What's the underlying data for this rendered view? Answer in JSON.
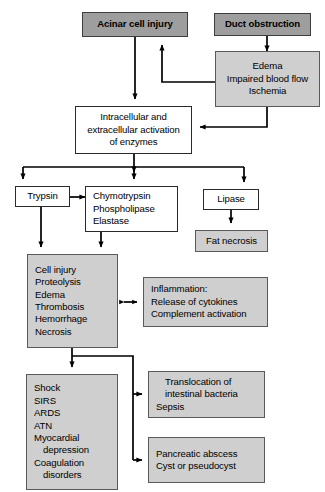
{
  "diagram": {
    "colors": {
      "node_dark_fill": "#9e9e9e",
      "node_gray_fill": "#cfcfcf",
      "node_white_fill": "#ffffff",
      "edge_stroke": "#000000",
      "text": "#000000"
    },
    "nodes": {
      "acinar_cell_injury": {
        "label": "Acinar cell injury"
      },
      "duct_obstruction": {
        "label": "Duct obstruction"
      },
      "edema_block": {
        "lines": [
          "Edema",
          "Impaired blood flow",
          "Ischemia"
        ]
      },
      "enzyme_activation": {
        "lines": [
          "Intracellular and",
          "extracellular activation",
          "of enzymes"
        ]
      },
      "trypsin": {
        "label": "Trypsin"
      },
      "chymotrypsin_group": {
        "lines": [
          "Chymotrypsin",
          "Phospholipase",
          "Elastase"
        ]
      },
      "lipase": {
        "label": "Lipase"
      },
      "fat_necrosis": {
        "label": "Fat necrosis"
      },
      "cell_injury_block": {
        "lines": [
          "Cell injury",
          "Proteolysis",
          "Edema",
          "Thrombosis",
          "Hemorrhage",
          "Necrosis"
        ]
      },
      "inflammation_block": {
        "lines": [
          "Inflammation:",
          "Release of cytokines",
          "Complement activation"
        ]
      },
      "systemic_block": {
        "lines": [
          "Shock",
          "SIRS",
          "ARDS",
          "ATN",
          "Myocardial",
          "depression",
          "Coagulation",
          "disorders"
        ],
        "indented_lines": [
          5,
          7
        ]
      },
      "translocation_block": {
        "lines": [
          "Translocation of",
          "intestinal bacteria",
          "Sepsis"
        ],
        "indented_lines": [
          1
        ]
      },
      "abscess_block": {
        "lines": [
          "Pancreatic abscess",
          "Cyst or pseudocyst"
        ]
      }
    },
    "edges": [
      {
        "from": "acinar_cell_injury",
        "to": "enzyme_activation",
        "style": "arrow-down"
      },
      {
        "from": "duct_obstruction",
        "to": "edema_block",
        "style": "arrow-down"
      },
      {
        "from": "edema_block",
        "to": "acinar_cell_injury",
        "style": "feedback-arrow-up"
      },
      {
        "from": "edema_block",
        "to": "enzyme_activation",
        "style": "arrow-left"
      },
      {
        "from": "enzyme_activation",
        "to": "trypsin",
        "style": "split-arrow-down"
      },
      {
        "from": "enzyme_activation",
        "to": "chymotrypsin_group",
        "style": "split-arrow-down"
      },
      {
        "from": "enzyme_activation",
        "to": "lipase",
        "style": "split-arrow-down"
      },
      {
        "from": "trypsin",
        "to": "chymotrypsin_group",
        "style": "arrow-right"
      },
      {
        "from": "trypsin",
        "to": "cell_injury_block",
        "style": "arrow-down"
      },
      {
        "from": "chymotrypsin_group",
        "to": "cell_injury_block",
        "style": "arrow-down"
      },
      {
        "from": "lipase",
        "to": "fat_necrosis",
        "style": "arrow-down"
      },
      {
        "from": "cell_injury_block",
        "to": "inflammation_block",
        "style": "double-arrow-horizontal"
      },
      {
        "from": "cell_injury_block",
        "to": "systemic_block",
        "style": "arrow-down"
      },
      {
        "from": "cell_injury_block",
        "to": "translocation_block",
        "style": "elbow-arrow-right"
      },
      {
        "from": "cell_injury_block",
        "to": "abscess_block",
        "style": "elbow-arrow-right"
      }
    ]
  }
}
